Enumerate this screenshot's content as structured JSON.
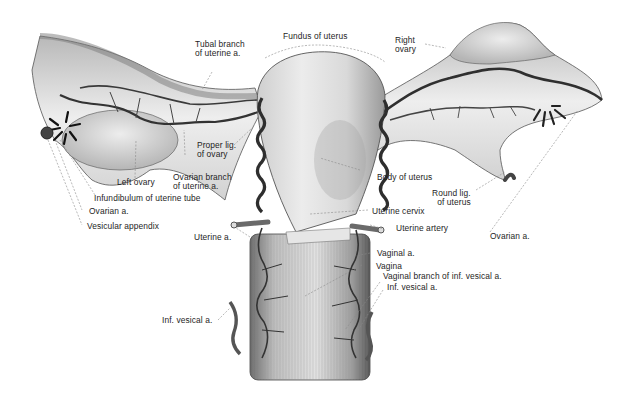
{
  "figure": {
    "colors": {
      "background": "#ffffff",
      "tissue_light": "#e8e8e8",
      "tissue_mid": "#bdbdbd",
      "tissue_dark": "#5a5a5a",
      "vessel": "#3a3a3a",
      "label_text": "#1e1e1e",
      "leader_line": "#8a8a8a"
    }
  },
  "labels": {
    "fundus_of_uterus": "Fundus of uterus",
    "tubal_branch": "Tubal branch\nof uterine a.",
    "right_ovary": "Right\novary",
    "proper_lig_of_ovary": "Proper lig.\nof ovary",
    "left_ovary": "Left ovary",
    "ovarian_branch": "Ovarian branch\nof uterine a.",
    "infundibulum": "Infundibulum of uterine tube",
    "ovarian_a_left": "Ovarian a.",
    "vesicular_appendix": "Vesicular appendix",
    "body_of_uterus": "Body of uterus",
    "round_lig_of_uterus": "Round lig.\nof uterus",
    "uterine_cervix": "Uterine cervix",
    "uterine_artery": "Uterine artery",
    "ovarian_a_right": "Ovarian a.",
    "uterine_a": "Uterine a.",
    "vaginal_a": "Vaginal a.",
    "vagina": "Vagina",
    "vaginal_branch": "Vaginal branch of inf. vesical a.",
    "inf_vesical_a_right": "Inf. vesical a.",
    "inf_vesical_a_left": "Inf. vesical a."
  }
}
